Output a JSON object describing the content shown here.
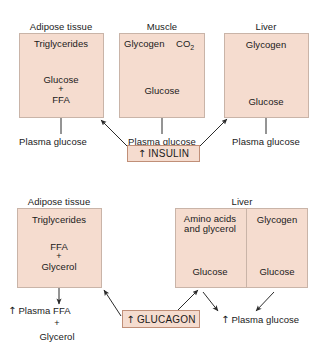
{
  "figure": {
    "colors": {
      "panel_fill": "#f5dccf",
      "panel_border": "#c9b4a8",
      "hormone_border": "#c08f78",
      "arrow": "#2b2b2b",
      "text": "#1a1a1a",
      "background": "#ffffff"
    }
  },
  "insulin_section": {
    "hormone_box": {
      "arrow_symbol": "↑",
      "label": "INSULIN"
    },
    "panels": [
      {
        "header": "Adipose tissue",
        "items": [
          "Triglycerides",
          "Glucose",
          "+",
          "FFA"
        ],
        "input_label": "Plasma glucose"
      },
      {
        "header": "Muscle",
        "items": [
          "Glycogen",
          "CO2",
          "Glucose"
        ],
        "co2_base": "CO",
        "co2_sub": "2",
        "input_label": "Plasma glucose"
      },
      {
        "header": "Liver",
        "items": [
          "Glycogen",
          "Glucose"
        ],
        "input_label": "Plasma glucose"
      }
    ]
  },
  "glucagon_section": {
    "hormone_box": {
      "arrow_symbol": "↑",
      "label": "GLUCAGON"
    },
    "panels": [
      {
        "header": "Adipose tissue",
        "items": [
          "Triglycerides",
          "FFA",
          "+",
          "Glycerol"
        ],
        "output_lines": [
          "Plasma FFA",
          "+",
          "Glycerol"
        ],
        "output_arrow_symbol": "↑"
      },
      {
        "header": "Liver",
        "left_sub": {
          "source_line1": "Amino acids",
          "source_line2": "and glycerol",
          "product": "Glucose"
        },
        "right_sub": {
          "source": "Glycogen",
          "product": "Glucose"
        },
        "output_label": "Plasma glucose",
        "output_arrow_symbol": "↑"
      }
    ]
  }
}
